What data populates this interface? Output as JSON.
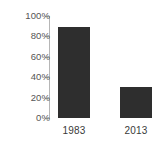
{
  "chart_data": {
    "type": "bar",
    "title": "",
    "subtitle": "",
    "xlabel": "",
    "ylabel": "",
    "categories": [
      "1983",
      "2013"
    ],
    "values": [
      89,
      30
    ],
    "value_unit": "%",
    "ylim": [
      0,
      100
    ],
    "yticks": [
      0,
      20,
      40,
      60,
      80,
      100
    ],
    "ytick_labels": [
      "0%",
      "20%",
      "40%",
      "60%",
      "80%",
      "100%"
    ],
    "grid": false,
    "legend": null,
    "legend_position": "none",
    "series": [
      {
        "name": "",
        "values": [
          89,
          30
        ],
        "color": "#2e2e2e"
      }
    ],
    "colors": {
      "bar": "#2e2e2e",
      "axis": "#b6b6b6",
      "tick_text": "#555555",
      "category_text": "#3a3a3a",
      "background": "#ffffff"
    }
  }
}
